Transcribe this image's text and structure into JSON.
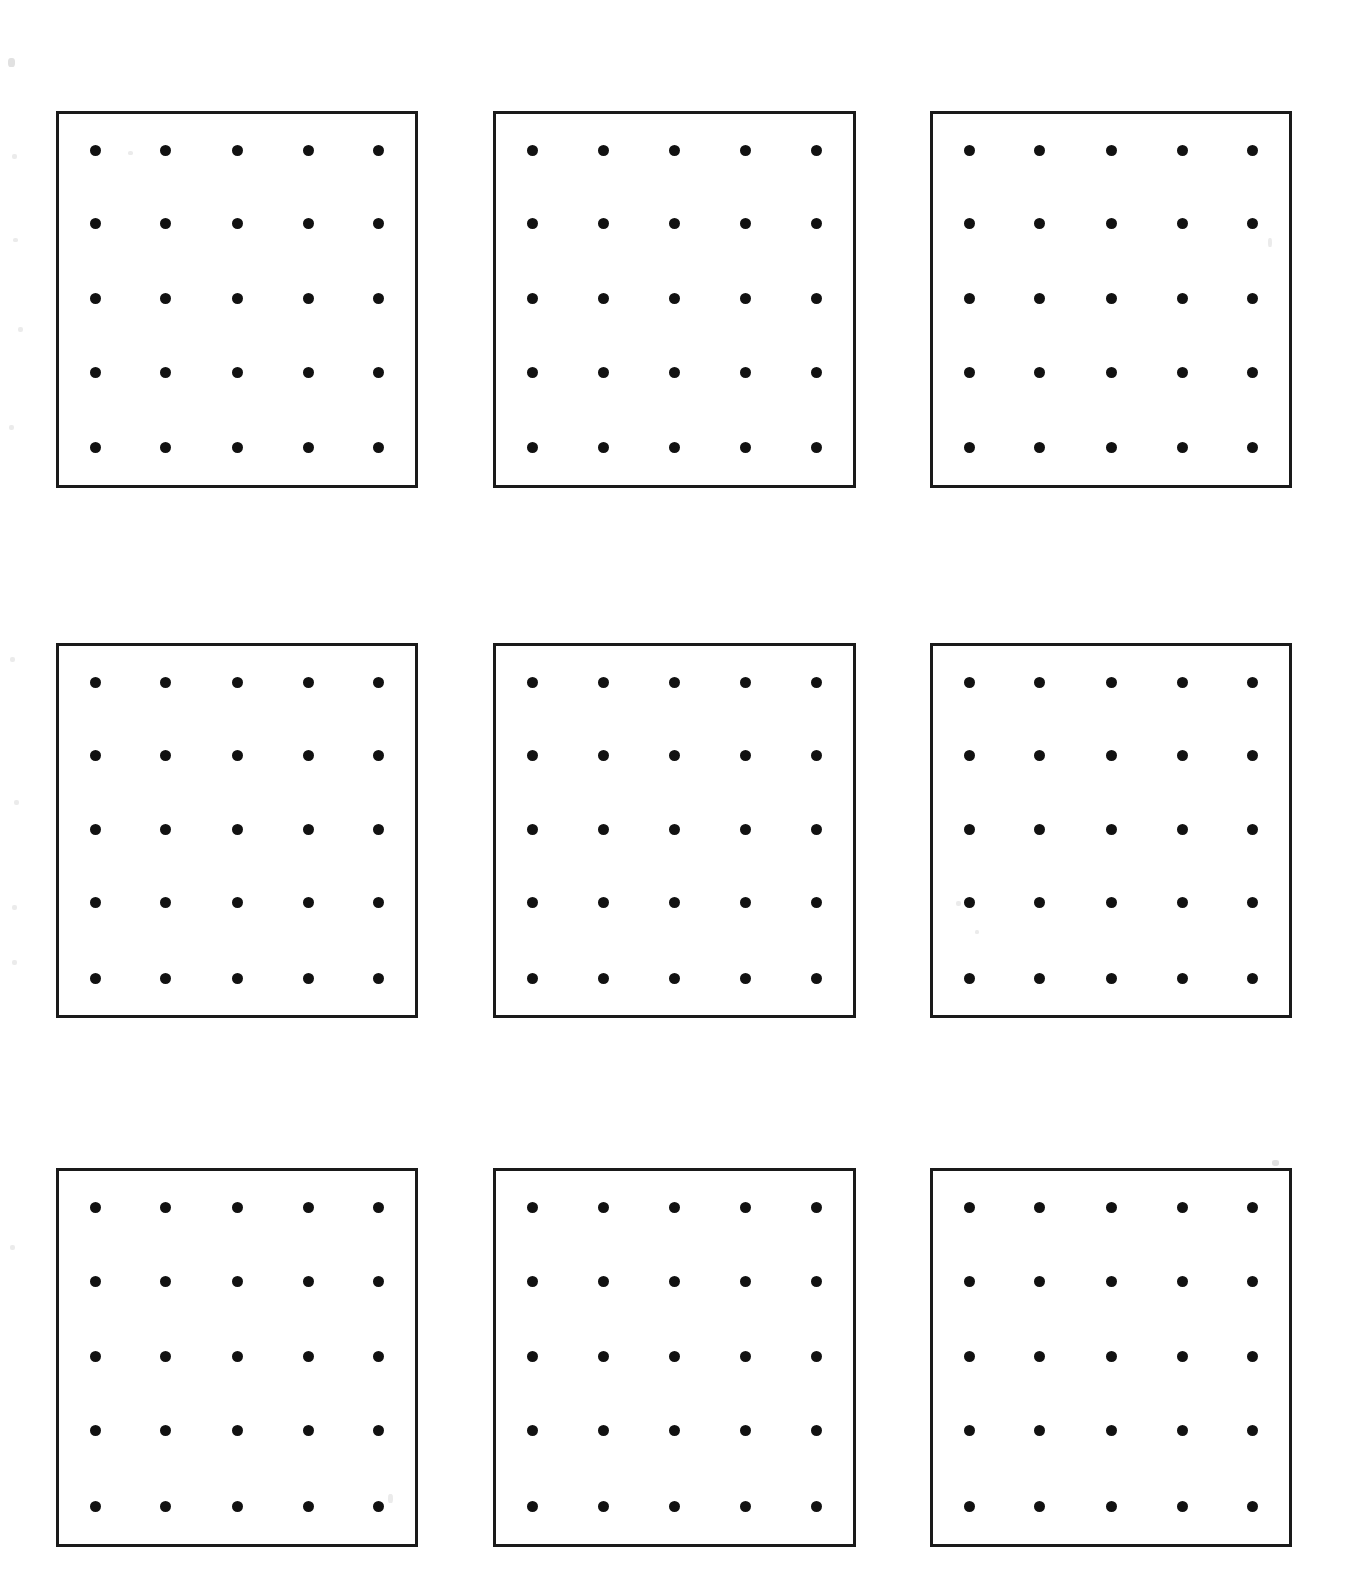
{
  "document": {
    "title": "Dot Grid Worksheet",
    "page_background": "#ffffff",
    "ink_color": "#111111",
    "border_color": "#1a1a1a"
  },
  "worksheet": {
    "panel_rows": 3,
    "panel_columns": 3,
    "panel_count": 9,
    "dots_per_row": 5,
    "dots_per_column": 5,
    "dots_per_panel": 25,
    "total_dots": 225
  },
  "chart_data": {
    "type": "scatter",
    "subtitle": "",
    "xlabel": "",
    "ylabel": "",
    "grid": false,
    "legend": null,
    "panel_layout": {
      "rows": 3,
      "cols": 3
    },
    "panel_geometry_px": [
      {
        "id": 1,
        "row": 1,
        "col": 1,
        "x": 56,
        "y": 111,
        "w": 362,
        "h": 377
      },
      {
        "id": 2,
        "row": 1,
        "col": 2,
        "x": 493,
        "y": 111,
        "w": 363,
        "h": 377
      },
      {
        "id": 3,
        "row": 1,
        "col": 3,
        "x": 930,
        "y": 111,
        "w": 362,
        "h": 377
      },
      {
        "id": 4,
        "row": 2,
        "col": 1,
        "x": 56,
        "y": 643,
        "w": 362,
        "h": 375
      },
      {
        "id": 5,
        "row": 2,
        "col": 2,
        "x": 493,
        "y": 643,
        "w": 363,
        "h": 375
      },
      {
        "id": 6,
        "row": 2,
        "col": 3,
        "x": 930,
        "y": 643,
        "w": 362,
        "h": 375
      },
      {
        "id": 7,
        "row": 3,
        "col": 1,
        "x": 56,
        "y": 1168,
        "w": 362,
        "h": 379
      },
      {
        "id": 8,
        "row": 3,
        "col": 2,
        "x": 493,
        "y": 1168,
        "w": 363,
        "h": 379
      },
      {
        "id": 9,
        "row": 3,
        "col": 3,
        "x": 930,
        "y": 1168,
        "w": 362,
        "h": 379
      }
    ],
    "dot_grid": {
      "x": [
        1,
        2,
        3,
        4,
        5
      ],
      "y": [
        1,
        2,
        3,
        4,
        5
      ],
      "x_fraction": [
        0.102,
        0.3,
        0.5,
        0.7,
        0.898
      ],
      "y_fraction": [
        0.098,
        0.296,
        0.496,
        0.696,
        0.9
      ],
      "marker": "filled-circle",
      "marker_size_px": 11,
      "marker_color": "#111111"
    },
    "panels": [
      {
        "id": 1,
        "label": "",
        "points": [
          [
            1,
            1
          ],
          [
            2,
            1
          ],
          [
            3,
            1
          ],
          [
            4,
            1
          ],
          [
            5,
            1
          ],
          [
            1,
            2
          ],
          [
            2,
            2
          ],
          [
            3,
            2
          ],
          [
            4,
            2
          ],
          [
            5,
            2
          ],
          [
            1,
            3
          ],
          [
            2,
            3
          ],
          [
            3,
            3
          ],
          [
            4,
            3
          ],
          [
            5,
            3
          ],
          [
            1,
            4
          ],
          [
            2,
            4
          ],
          [
            3,
            4
          ],
          [
            4,
            4
          ],
          [
            5,
            4
          ],
          [
            1,
            5
          ],
          [
            2,
            5
          ],
          [
            3,
            5
          ],
          [
            4,
            5
          ],
          [
            5,
            5
          ]
        ]
      },
      {
        "id": 2,
        "label": "",
        "points": [
          [
            1,
            1
          ],
          [
            2,
            1
          ],
          [
            3,
            1
          ],
          [
            4,
            1
          ],
          [
            5,
            1
          ],
          [
            1,
            2
          ],
          [
            2,
            2
          ],
          [
            3,
            2
          ],
          [
            4,
            2
          ],
          [
            5,
            2
          ],
          [
            1,
            3
          ],
          [
            2,
            3
          ],
          [
            3,
            3
          ],
          [
            4,
            3
          ],
          [
            5,
            3
          ],
          [
            1,
            4
          ],
          [
            2,
            4
          ],
          [
            3,
            4
          ],
          [
            4,
            4
          ],
          [
            5,
            4
          ],
          [
            1,
            5
          ],
          [
            2,
            5
          ],
          [
            3,
            5
          ],
          [
            4,
            5
          ],
          [
            5,
            5
          ]
        ]
      },
      {
        "id": 3,
        "label": "",
        "points": [
          [
            1,
            1
          ],
          [
            2,
            1
          ],
          [
            3,
            1
          ],
          [
            4,
            1
          ],
          [
            5,
            1
          ],
          [
            1,
            2
          ],
          [
            2,
            2
          ],
          [
            3,
            2
          ],
          [
            4,
            2
          ],
          [
            5,
            2
          ],
          [
            1,
            3
          ],
          [
            2,
            3
          ],
          [
            3,
            3
          ],
          [
            4,
            3
          ],
          [
            5,
            3
          ],
          [
            1,
            4
          ],
          [
            2,
            4
          ],
          [
            3,
            4
          ],
          [
            4,
            4
          ],
          [
            5,
            4
          ],
          [
            1,
            5
          ],
          [
            2,
            5
          ],
          [
            3,
            5
          ],
          [
            4,
            5
          ],
          [
            5,
            5
          ]
        ]
      },
      {
        "id": 4,
        "label": "",
        "points": [
          [
            1,
            1
          ],
          [
            2,
            1
          ],
          [
            3,
            1
          ],
          [
            4,
            1
          ],
          [
            5,
            1
          ],
          [
            1,
            2
          ],
          [
            2,
            2
          ],
          [
            3,
            2
          ],
          [
            4,
            2
          ],
          [
            5,
            2
          ],
          [
            1,
            3
          ],
          [
            2,
            3
          ],
          [
            3,
            3
          ],
          [
            4,
            3
          ],
          [
            5,
            3
          ],
          [
            1,
            4
          ],
          [
            2,
            4
          ],
          [
            3,
            4
          ],
          [
            4,
            4
          ],
          [
            5,
            4
          ],
          [
            1,
            5
          ],
          [
            2,
            5
          ],
          [
            3,
            5
          ],
          [
            4,
            5
          ],
          [
            5,
            5
          ]
        ]
      },
      {
        "id": 5,
        "label": "",
        "points": [
          [
            1,
            1
          ],
          [
            2,
            1
          ],
          [
            3,
            1
          ],
          [
            4,
            1
          ],
          [
            5,
            1
          ],
          [
            1,
            2
          ],
          [
            2,
            2
          ],
          [
            3,
            2
          ],
          [
            4,
            2
          ],
          [
            5,
            2
          ],
          [
            1,
            3
          ],
          [
            2,
            3
          ],
          [
            3,
            3
          ],
          [
            4,
            3
          ],
          [
            5,
            3
          ],
          [
            1,
            4
          ],
          [
            2,
            4
          ],
          [
            3,
            4
          ],
          [
            4,
            4
          ],
          [
            5,
            4
          ],
          [
            1,
            5
          ],
          [
            2,
            5
          ],
          [
            3,
            5
          ],
          [
            4,
            5
          ],
          [
            5,
            5
          ]
        ]
      },
      {
        "id": 6,
        "label": "",
        "points": [
          [
            1,
            1
          ],
          [
            2,
            1
          ],
          [
            3,
            1
          ],
          [
            4,
            1
          ],
          [
            5,
            1
          ],
          [
            1,
            2
          ],
          [
            2,
            2
          ],
          [
            3,
            2
          ],
          [
            4,
            2
          ],
          [
            5,
            2
          ],
          [
            1,
            3
          ],
          [
            2,
            3
          ],
          [
            3,
            3
          ],
          [
            4,
            3
          ],
          [
            5,
            3
          ],
          [
            1,
            4
          ],
          [
            2,
            4
          ],
          [
            3,
            4
          ],
          [
            4,
            4
          ],
          [
            5,
            4
          ],
          [
            1,
            5
          ],
          [
            2,
            5
          ],
          [
            3,
            5
          ],
          [
            4,
            5
          ],
          [
            5,
            5
          ]
        ]
      },
      {
        "id": 7,
        "label": "",
        "points": [
          [
            1,
            1
          ],
          [
            2,
            1
          ],
          [
            3,
            1
          ],
          [
            4,
            1
          ],
          [
            5,
            1
          ],
          [
            1,
            2
          ],
          [
            2,
            2
          ],
          [
            3,
            2
          ],
          [
            4,
            2
          ],
          [
            5,
            2
          ],
          [
            1,
            3
          ],
          [
            2,
            3
          ],
          [
            3,
            3
          ],
          [
            4,
            3
          ],
          [
            5,
            3
          ],
          [
            1,
            4
          ],
          [
            2,
            4
          ],
          [
            3,
            4
          ],
          [
            4,
            4
          ],
          [
            5,
            4
          ],
          [
            1,
            5
          ],
          [
            2,
            5
          ],
          [
            3,
            5
          ],
          [
            4,
            5
          ],
          [
            5,
            5
          ]
        ]
      },
      {
        "id": 8,
        "label": "",
        "points": [
          [
            1,
            1
          ],
          [
            2,
            1
          ],
          [
            3,
            1
          ],
          [
            4,
            1
          ],
          [
            5,
            1
          ],
          [
            1,
            2
          ],
          [
            2,
            2
          ],
          [
            3,
            2
          ],
          [
            4,
            2
          ],
          [
            5,
            2
          ],
          [
            1,
            3
          ],
          [
            2,
            3
          ],
          [
            3,
            3
          ],
          [
            4,
            3
          ],
          [
            5,
            3
          ],
          [
            1,
            4
          ],
          [
            2,
            4
          ],
          [
            3,
            4
          ],
          [
            4,
            4
          ],
          [
            5,
            4
          ],
          [
            1,
            5
          ],
          [
            2,
            5
          ],
          [
            3,
            5
          ],
          [
            4,
            5
          ],
          [
            5,
            5
          ]
        ]
      },
      {
        "id": 9,
        "label": "",
        "points": [
          [
            1,
            1
          ],
          [
            2,
            1
          ],
          [
            3,
            1
          ],
          [
            4,
            1
          ],
          [
            5,
            1
          ],
          [
            1,
            2
          ],
          [
            2,
            2
          ],
          [
            3,
            2
          ],
          [
            4,
            2
          ],
          [
            5,
            2
          ],
          [
            1,
            3
          ],
          [
            2,
            3
          ],
          [
            3,
            3
          ],
          [
            4,
            3
          ],
          [
            5,
            3
          ],
          [
            1,
            4
          ],
          [
            2,
            4
          ],
          [
            3,
            4
          ],
          [
            4,
            4
          ],
          [
            5,
            4
          ],
          [
            1,
            5
          ],
          [
            2,
            5
          ],
          [
            3,
            5
          ],
          [
            4,
            5
          ],
          [
            5,
            5
          ]
        ]
      }
    ]
  },
  "scan_artifacts": [
    {
      "x": 8,
      "y": 58,
      "w": 7,
      "h": 9
    },
    {
      "x": 12,
      "y": 154,
      "w": 5,
      "h": 5
    },
    {
      "x": 13,
      "y": 238,
      "w": 5,
      "h": 4
    },
    {
      "x": 18,
      "y": 327,
      "w": 5,
      "h": 5
    },
    {
      "x": 9,
      "y": 425,
      "w": 5,
      "h": 5
    },
    {
      "x": 10,
      "y": 657,
      "w": 5,
      "h": 5
    },
    {
      "x": 14,
      "y": 800,
      "w": 5,
      "h": 5
    },
    {
      "x": 12,
      "y": 905,
      "w": 5,
      "h": 5
    },
    {
      "x": 12,
      "y": 960,
      "w": 5,
      "h": 5
    },
    {
      "x": 10,
      "y": 1245,
      "w": 5,
      "h": 5
    },
    {
      "x": 128,
      "y": 151,
      "w": 5,
      "h": 4
    },
    {
      "x": 1268,
      "y": 238,
      "w": 4,
      "h": 9
    },
    {
      "x": 956,
      "y": 901,
      "w": 5,
      "h": 5
    },
    {
      "x": 975,
      "y": 930,
      "w": 4,
      "h": 4
    },
    {
      "x": 388,
      "y": 1494,
      "w": 5,
      "h": 9
    },
    {
      "x": 1272,
      "y": 1160,
      "w": 7,
      "h": 6
    }
  ]
}
